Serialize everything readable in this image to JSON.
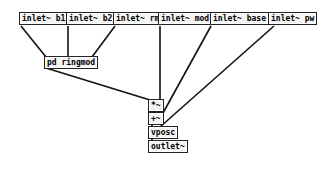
{
  "patch": {
    "objects": [
      {
        "id": "inlet_b1",
        "label": "inlet~ b1"
      },
      {
        "id": "inlet_b2",
        "label": "inlet~ b2"
      },
      {
        "id": "inlet_rm",
        "label": "inlet~ rm"
      },
      {
        "id": "inlet_mod",
        "label": "inlet~ mod"
      },
      {
        "id": "inlet_base",
        "label": "inlet~ base"
      },
      {
        "id": "inlet_pw",
        "label": "inlet~ pw"
      },
      {
        "id": "pd_ringmod",
        "label": "pd ringmod"
      },
      {
        "id": "mul",
        "label": "*~"
      },
      {
        "id": "add",
        "label": "+~"
      },
      {
        "id": "vposc",
        "label": "vposc"
      },
      {
        "id": "outlet",
        "label": "outlet~"
      }
    ]
  }
}
